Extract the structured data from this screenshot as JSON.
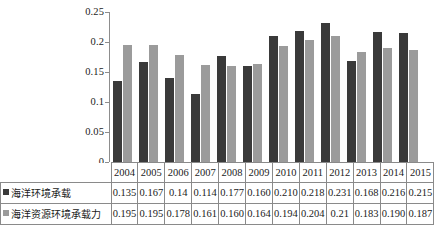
{
  "chart_data": {
    "type": "bar",
    "title": "",
    "xlabel": "",
    "ylabel": "",
    "ylim": [
      0,
      0.25
    ],
    "ytick_labels": [
      "0.25",
      "0.2",
      "0.15",
      "0.1",
      "0.05",
      "0"
    ],
    "yticks": [
      0.25,
      0.2,
      0.15,
      0.1,
      0.05,
      0
    ],
    "grid": false,
    "legend_position": "data-table-below",
    "categories": [
      "2004",
      "2005",
      "2006",
      "2007",
      "2008",
      "2009",
      "2010",
      "2011",
      "2012",
      "2013",
      "2014",
      "2015"
    ],
    "series": [
      {
        "name": "海洋环境承载",
        "color": "#3a3a3a",
        "marker": "■",
        "values": [
          0.135,
          0.167,
          0.14,
          0.114,
          0.177,
          0.16,
          0.21,
          0.218,
          0.231,
          0.168,
          0.216,
          0.215
        ],
        "value_labels": [
          "0.135",
          "0.167",
          "0.14",
          "0.114",
          "0.177",
          "0.160",
          "0.210",
          "0.218",
          "0.231",
          "0.168",
          "0.216",
          "0.215"
        ]
      },
      {
        "name": "海洋资源环境承载力",
        "color": "#9b9b9b",
        "marker": "■",
        "values": [
          0.195,
          0.195,
          0.178,
          0.161,
          0.16,
          0.164,
          0.194,
          0.204,
          0.21,
          0.183,
          0.19,
          0.187
        ],
        "value_labels": [
          "0.195",
          "0.195",
          "0.178",
          "0.161",
          "0.160",
          "0.164",
          "0.194",
          "0.204",
          "0.21",
          "0.183",
          "0.190",
          "0.187"
        ]
      }
    ]
  },
  "table": {
    "corner_label": "",
    "header_row_name": "years"
  }
}
